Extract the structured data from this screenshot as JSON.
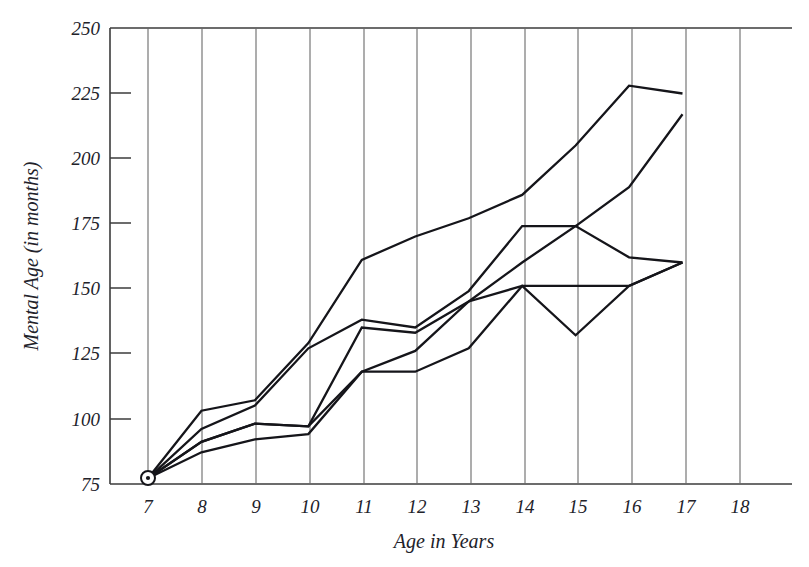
{
  "chart_data": {
    "type": "line",
    "title": "",
    "xlabel": "Age in Years",
    "ylabel": "Mental Age (in months)",
    "xlim": [
      7,
      18
    ],
    "ylim": [
      75,
      250
    ],
    "xticks": [
      "7",
      "8",
      "9",
      "10",
      "11",
      "12",
      "13",
      "14",
      "15",
      "16",
      "17",
      "18"
    ],
    "yticks": [
      "75",
      "100",
      "125",
      "150",
      "175",
      "200",
      "225",
      "250"
    ],
    "grid": "vertical",
    "legend": "none",
    "x": [
      7,
      8,
      9,
      10,
      11,
      12,
      13,
      14,
      15,
      16,
      17
    ],
    "series": [
      {
        "name": "Curve A",
        "values": [
          77,
          103,
          107,
          129,
          161,
          170,
          177,
          186,
          205,
          228,
          225
        ]
      },
      {
        "name": "Curve B",
        "values": [
          77,
          96,
          105,
          127,
          138,
          135,
          149,
          174,
          174,
          189,
          217
        ]
      },
      {
        "name": "Curve C",
        "values": [
          77,
          91,
          98,
          97,
          135,
          133,
          145,
          160,
          174,
          162,
          160
        ]
      },
      {
        "name": "Curve D",
        "values": [
          77,
          87,
          92,
          94,
          118,
          118,
          127,
          151,
          132,
          151,
          160
        ]
      },
      {
        "name": "Curve E",
        "values": [
          77,
          91,
          98,
          97,
          118,
          126,
          145,
          151,
          151,
          151,
          160
        ]
      }
    ],
    "origin_marker": {
      "label": "origin-point",
      "x": 7,
      "y": 77
    }
  },
  "axis": {
    "x_title": "Age in Years",
    "y_title": "Mental Age (in months)"
  }
}
